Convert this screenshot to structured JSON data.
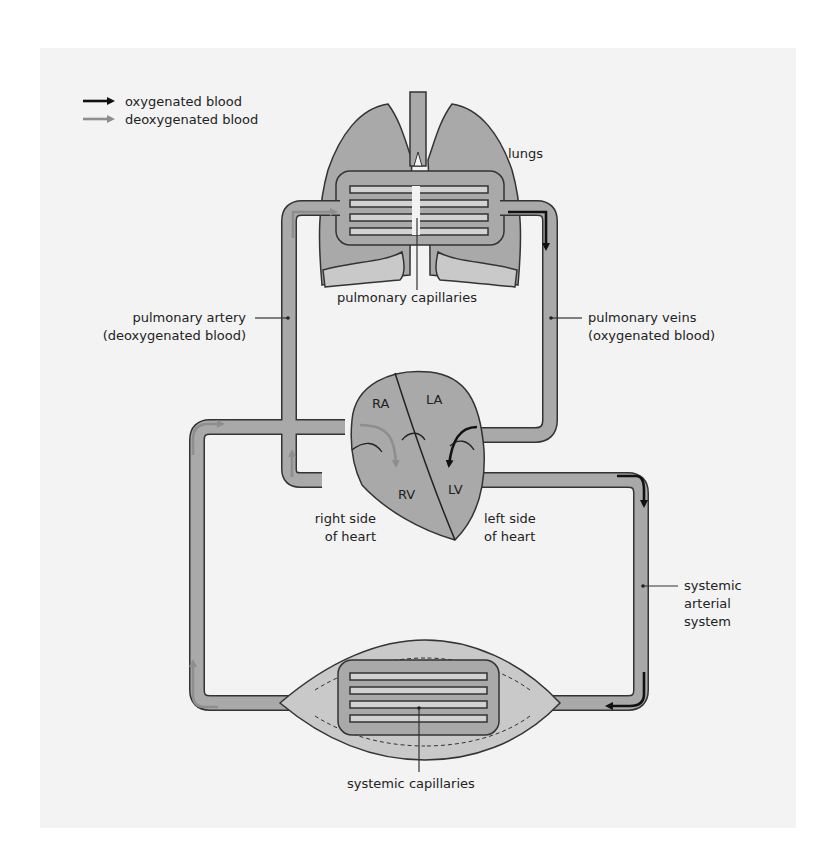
{
  "legend": {
    "oxygenated": {
      "label": "oxygenated blood",
      "color": "#111111"
    },
    "deoxygenated": {
      "label": "deoxygenated blood",
      "color": "#8e8e8e"
    }
  },
  "labels": {
    "lungs": "lungs",
    "pulmonary_capillaries": "pulmonary capillaries",
    "pulmonary_artery": [
      "pulmonary artery",
      "(deoxygenated blood)"
    ],
    "pulmonary_veins": [
      "pulmonary veins",
      "(oxygenated blood)"
    ],
    "right_side": [
      "right side",
      "of heart"
    ],
    "left_side": [
      "left side",
      "of heart"
    ],
    "systemic_arterial": [
      "systemic",
      "arterial",
      "system"
    ],
    "systemic_capillaries": "systemic capillaries"
  },
  "heart": {
    "chambers": {
      "ra": "RA",
      "la": "LA",
      "rv": "RV",
      "lv": "LV"
    }
  },
  "colors": {
    "background": "#f3f3f3",
    "vessel_fill": "#a9a9a9",
    "outline": "#333333",
    "capillary_fill": "#d2d2d2"
  }
}
